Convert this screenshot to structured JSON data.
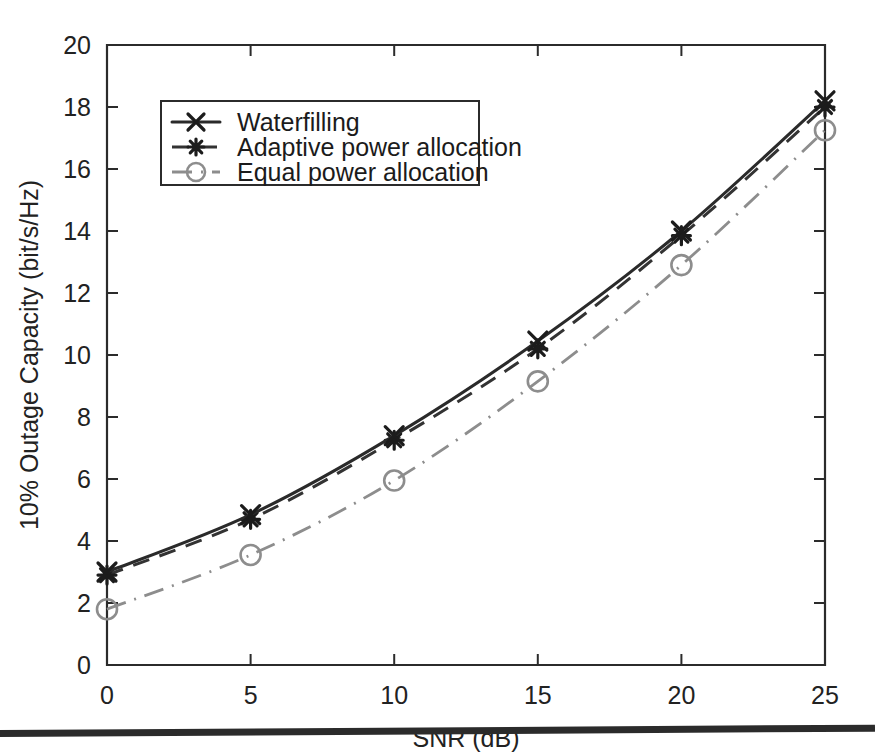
{
  "chart_data": {
    "type": "line",
    "title": "",
    "subtitle": "",
    "xlabel": "SNR (dB)",
    "ylabel": "10% Outage Capacity (bit/s/Hz)",
    "x": [
      0,
      5,
      10,
      15,
      20,
      25
    ],
    "xlim": [
      0,
      25
    ],
    "ylim": [
      0,
      20
    ],
    "xticks": [
      0,
      5,
      10,
      15,
      20,
      25
    ],
    "yticks": [
      0,
      2,
      4,
      6,
      8,
      10,
      12,
      14,
      16,
      18,
      20
    ],
    "xticklabels": [
      "0",
      "5",
      "10",
      "15",
      "20",
      "25"
    ],
    "yticklabels": [
      "0",
      "2",
      "4",
      "6",
      "8",
      "10",
      "12",
      "14",
      "16",
      "18",
      "20"
    ],
    "grid": false,
    "legend_position": "upper-left",
    "series": [
      {
        "name": "Waterfilling",
        "values": [
          3.0,
          4.85,
          7.4,
          10.45,
          14.0,
          18.2
        ],
        "linestyle": "solid",
        "marker": "x",
        "color": "#2a2a2a"
      },
      {
        "name": "Adaptive power allocation",
        "values": [
          2.9,
          4.7,
          7.25,
          10.2,
          13.85,
          18.0
        ],
        "linestyle": "dashed",
        "marker": "star",
        "color": "#333333"
      },
      {
        "name": "Equal power allocation",
        "values": [
          1.8,
          3.55,
          5.95,
          9.15,
          12.9,
          17.25
        ],
        "linestyle": "dashdot",
        "marker": "circle",
        "color": "#8d8d8d"
      }
    ]
  },
  "legend": {
    "items": [
      {
        "label": "Waterfilling",
        "marker_icon": "x-marker-icon"
      },
      {
        "label": "Adaptive power allocation",
        "marker_icon": "star-marker-icon"
      },
      {
        "label": "Equal power allocation",
        "marker_icon": "circle-marker-icon"
      }
    ]
  },
  "axes": {
    "x_title": "SNR (dB)",
    "y_title": "10% Outage Capacity (bit/s/Hz)"
  }
}
